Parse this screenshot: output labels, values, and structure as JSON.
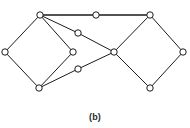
{
  "figure": {
    "caption": "(b)",
    "caption_x": 95,
    "caption_y": 112,
    "width": 190,
    "height": 128,
    "background_color": "#ffffff",
    "ink_color": "#1c1c1c",
    "vertex_fill_color": "#ffffff"
  },
  "chart_data": {
    "type": "diagram",
    "title": "(b)",
    "vertex_count": 11,
    "edge_count": 14,
    "vertex_radius": 3.2,
    "nodes": [
      {
        "id": "v1",
        "label": "",
        "name": "top-left-vertex",
        "x": 40,
        "y": 15
      },
      {
        "id": "v2",
        "label": "",
        "name": "left-vertex",
        "x": 5,
        "y": 52
      },
      {
        "id": "v3",
        "label": "",
        "name": "bottom-left-vertex",
        "x": 39,
        "y": 88
      },
      {
        "id": "v4",
        "label": "",
        "name": "left-diamond-right-vertex",
        "x": 73,
        "y": 52
      },
      {
        "id": "v5",
        "label": "",
        "name": "upper-middle-vertex",
        "x": 78,
        "y": 33
      },
      {
        "id": "v6",
        "label": "",
        "name": "lower-middle-vertex",
        "x": 78,
        "y": 69
      },
      {
        "id": "v7",
        "label": "",
        "name": "top-middle-vertex",
        "x": 96,
        "y": 15
      },
      {
        "id": "v8",
        "label": "",
        "name": "center-vertex",
        "x": 114,
        "y": 52
      },
      {
        "id": "v9",
        "label": "",
        "name": "top-right-vertex",
        "x": 150,
        "y": 15
      },
      {
        "id": "v10",
        "label": "",
        "name": "far-right-vertex",
        "x": 183,
        "y": 52
      },
      {
        "id": "v11",
        "label": "",
        "name": "bottom-right-vertex",
        "x": 150,
        "y": 88
      }
    ],
    "edges": [
      {
        "from": "v1",
        "to": "v2",
        "name": "edge-topleft-left",
        "weight": "normal"
      },
      {
        "from": "v2",
        "to": "v3",
        "name": "edge-left-bottomleft",
        "weight": "normal"
      },
      {
        "from": "v3",
        "to": "v4",
        "name": "edge-bottomleft-diamondright",
        "weight": "normal"
      },
      {
        "from": "v4",
        "to": "v1",
        "name": "edge-diamondright-topleft",
        "weight": "normal"
      },
      {
        "from": "v1",
        "to": "v7",
        "name": "edge-topleft-topmiddle",
        "weight": "thick"
      },
      {
        "from": "v7",
        "to": "v9",
        "name": "edge-topmiddle-topright",
        "weight": "thick"
      },
      {
        "from": "v1",
        "to": "v5",
        "name": "edge-topleft-uppermiddle",
        "weight": "normal"
      },
      {
        "from": "v5",
        "to": "v8",
        "name": "edge-uppermiddle-center",
        "weight": "normal"
      },
      {
        "from": "v3",
        "to": "v6",
        "name": "edge-bottomleft-lowermiddle",
        "weight": "normal"
      },
      {
        "from": "v6",
        "to": "v8",
        "name": "edge-lowermiddle-center",
        "weight": "normal"
      },
      {
        "from": "v9",
        "to": "v8",
        "name": "edge-topright-center",
        "weight": "normal"
      },
      {
        "from": "v8",
        "to": "v11",
        "name": "edge-center-bottomright",
        "weight": "normal"
      },
      {
        "from": "v11",
        "to": "v10",
        "name": "edge-bottomright-farright",
        "weight": "normal"
      },
      {
        "from": "v10",
        "to": "v9",
        "name": "edge-farright-topright",
        "weight": "normal"
      }
    ]
  }
}
